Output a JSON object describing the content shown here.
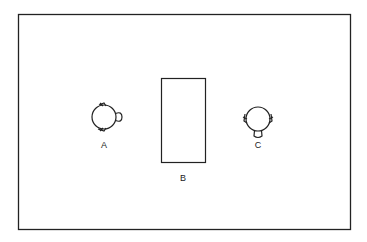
{
  "diagram": {
    "labels": {
      "a": "A",
      "b": "B",
      "c": "C"
    },
    "colors": {
      "stroke": "#222222",
      "background": "#ffffff"
    },
    "elements": [
      {
        "id": "A",
        "type": "head-top-view",
        "facing": "right"
      },
      {
        "id": "B",
        "type": "rectangle"
      },
      {
        "id": "C",
        "type": "head-top-view",
        "facing": "down"
      }
    ]
  }
}
